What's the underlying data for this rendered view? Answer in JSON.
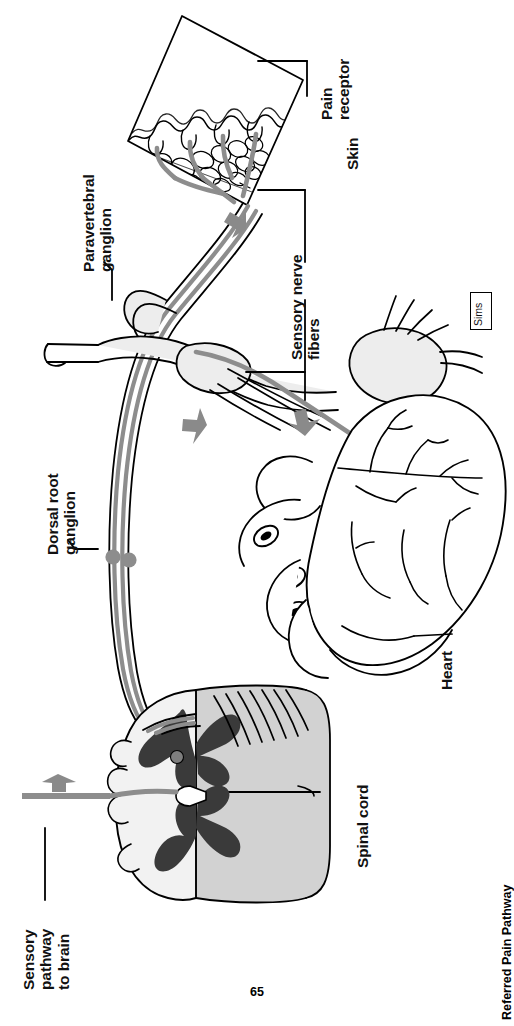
{
  "page": {
    "number": "65",
    "caption": "Referred Pain Pathway",
    "credit": "Sims"
  },
  "figure": {
    "title": "Referred Pain Pathway",
    "labels": [
      {
        "id": "pain-receptor",
        "text": "Pain\nreceptor"
      },
      {
        "id": "skin",
        "text": "Skin"
      },
      {
        "id": "paravertebral-ganglion",
        "text": "Paravertebral\nganglion"
      },
      {
        "id": "sensory-nerve-fibers",
        "text": "Sensory nerve\nfibers"
      },
      {
        "id": "dorsal-root-ganglion",
        "text": "Dorsal root\nganglion"
      },
      {
        "id": "heart",
        "text": "Heart"
      },
      {
        "id": "spinal-cord",
        "text": "Spinal cord"
      },
      {
        "id": "sensory-pathway",
        "text": "Sensory\npathway\nto brain"
      }
    ],
    "colors": {
      "outline": "#000000",
      "nerve_gray": "#8d8d8d",
      "fill_light": "#e8e8e8",
      "fill_mid": "#d2d2d2",
      "gray_matter": "#3a3a3a",
      "arrow_gray": "#8a8a8a",
      "background": "#ffffff"
    }
  }
}
